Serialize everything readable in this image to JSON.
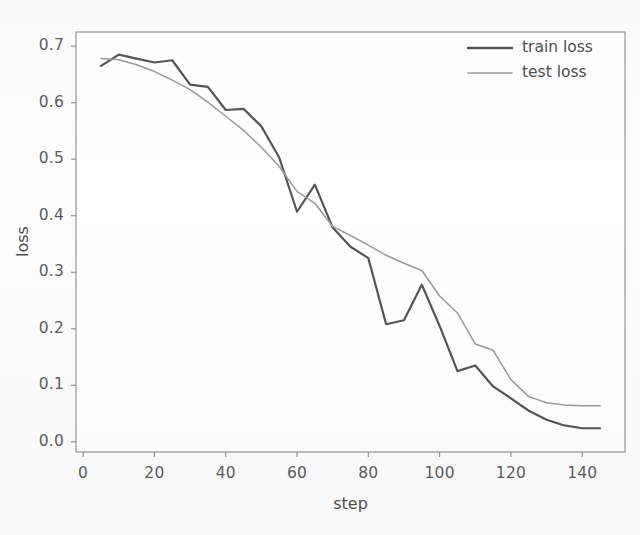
{
  "chart_data": {
    "type": "line",
    "title": "",
    "xlabel": "step",
    "ylabel": "loss",
    "xlim": [
      -2,
      152
    ],
    "ylim": [
      -0.018,
      0.725
    ],
    "grid": false,
    "legend_position": "upper right",
    "xticks": [
      0,
      20,
      40,
      60,
      80,
      100,
      120,
      140
    ],
    "xtick_labels": [
      "0",
      "20",
      "40",
      "60",
      "80",
      "100",
      "120",
      "140"
    ],
    "yticks": [
      0.0,
      0.1,
      0.2,
      0.3,
      0.4,
      0.5,
      0.6,
      0.7
    ],
    "ytick_labels": [
      "0.0",
      "0.1",
      "0.2",
      "0.3",
      "0.4",
      "0.5",
      "0.6",
      "0.7"
    ],
    "x": [
      5,
      10,
      15,
      20,
      25,
      30,
      35,
      40,
      45,
      50,
      55,
      60,
      65,
      70,
      75,
      80,
      85,
      90,
      95,
      100,
      105,
      110,
      115,
      120,
      125,
      130,
      135,
      140,
      145
    ],
    "series": [
      {
        "name": "train loss",
        "color": "#555555",
        "linewidth": 2.2,
        "values": [
          0.665,
          0.685,
          0.678,
          0.671,
          0.675,
          0.632,
          0.628,
          0.587,
          0.589,
          0.558,
          0.503,
          0.407,
          0.455,
          0.379,
          0.345,
          0.325,
          0.208,
          0.215,
          0.278,
          0.205,
          0.125,
          0.135,
          0.098,
          0.077,
          0.055,
          0.039,
          0.029,
          0.024,
          0.024
        ]
      },
      {
        "name": "test loss",
        "color": "#9a9a9a",
        "linewidth": 1.5,
        "values": [
          0.678,
          0.676,
          0.667,
          0.655,
          0.64,
          0.623,
          0.601,
          0.576,
          0.551,
          0.521,
          0.487,
          0.443,
          0.422,
          0.381,
          0.365,
          0.348,
          0.33,
          0.316,
          0.303,
          0.258,
          0.228,
          0.173,
          0.162,
          0.11,
          0.08,
          0.069,
          0.065,
          0.064,
          0.064
        ]
      }
    ]
  },
  "legend": {
    "entries": [
      {
        "label": "train loss",
        "color": "#555555"
      },
      {
        "label": "test loss",
        "color": "#9a9a9a"
      }
    ]
  },
  "axes": {
    "spine_color": "#8c8c8c",
    "tick_color": "#8c8c8c",
    "background": "#ffffff"
  }
}
